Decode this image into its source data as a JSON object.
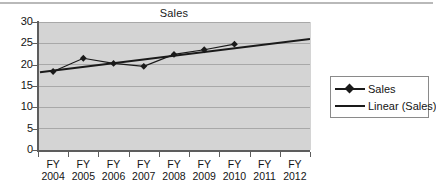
{
  "chart_data": {
    "type": "line",
    "title": "Sales",
    "xlabel": "",
    "ylabel": "",
    "categories": [
      "FY 2004",
      "FY 2005",
      "FY 2006",
      "FY 2007",
      "FY 2008",
      "FY 2009",
      "FY 2010",
      "FY 2011",
      "FY 2012"
    ],
    "category_lines": [
      [
        "FY",
        "2004"
      ],
      [
        "FY",
        "2005"
      ],
      [
        "FY",
        "2006"
      ],
      [
        "FY",
        "2007"
      ],
      [
        "FY",
        "2008"
      ],
      [
        "FY",
        "2009"
      ],
      [
        "FY",
        "2010"
      ],
      [
        "FY",
        "2011"
      ],
      [
        "FY",
        "2012"
      ]
    ],
    "series": [
      {
        "name": "Sales",
        "kind": "line-markers",
        "marker": "diamond",
        "color": "#1a1a1a",
        "values": [
          18.4,
          21.5,
          20.3,
          19.6,
          22.4,
          23.5,
          24.8,
          null,
          null
        ]
      },
      {
        "name": "Linear (Sales)",
        "kind": "trendline",
        "color": "#1a1a1a",
        "endpoints": [
          {
            "x_index": 0,
            "value": 18.2
          },
          {
            "x_index": 8,
            "value": 26.0
          }
        ]
      }
    ],
    "ylim": [
      0,
      30
    ],
    "y_ticks": [
      0,
      5,
      10,
      15,
      20,
      25,
      30
    ],
    "y_tick_labels": [
      "0",
      "5",
      "10",
      "15",
      "20",
      "25",
      "30"
    ],
    "grid": "horizontal",
    "gridline_color": "#a8a8a8",
    "plot_background": "#d4d4d4",
    "legend_position": "right"
  },
  "legend": {
    "entries": [
      {
        "label": "Sales"
      },
      {
        "label": "Linear (Sales)"
      }
    ]
  }
}
